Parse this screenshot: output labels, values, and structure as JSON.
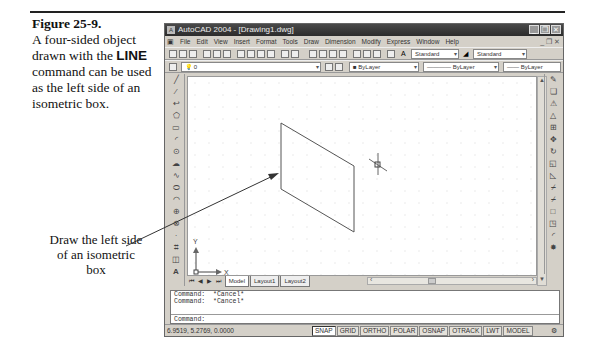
{
  "figure": {
    "number": "Figure 25-9.",
    "caption_before": "A four-sided object drawn with the",
    "caption_command": "LINE",
    "caption_after": "command can be used as the left side of an isometric box.",
    "callout": "Draw the left side of an isometric box"
  },
  "window": {
    "title": "AutoCAD 2004 - [Drawing1.dwg]",
    "controls": [
      "minimize",
      "restore",
      "close"
    ]
  },
  "menu": {
    "items": [
      "File",
      "Edit",
      "View",
      "Insert",
      "Format",
      "Tools",
      "Draw",
      "Dimension",
      "Modify",
      "Express",
      "Window",
      "Help"
    ]
  },
  "toolbars": {
    "text_style": "Standard",
    "dim_style": "Standard",
    "layer": "0",
    "color": "ByLayer",
    "linetype": "ByLayer",
    "lineweight": "ByLayer"
  },
  "draw_toolbar": [
    "line",
    "construction-line",
    "polyline",
    "polygon",
    "rectangle",
    "arc",
    "circle",
    "revision-cloud",
    "spline",
    "ellipse",
    "ellipse-arc",
    "insert-block",
    "make-block",
    "point",
    "hatch",
    "region",
    "multiline-text"
  ],
  "modify_toolbar": [
    "erase",
    "copy",
    "mirror",
    "offset",
    "array",
    "move",
    "rotate",
    "scale",
    "stretch",
    "trim",
    "extend",
    "break",
    "chamfer",
    "fillet",
    "explode"
  ],
  "ucs": {
    "x_label": "X",
    "y_label": "Y"
  },
  "layout_tabs": [
    {
      "label": "Model",
      "active": true
    },
    {
      "label": "Layout1",
      "active": false
    },
    {
      "label": "Layout2",
      "active": false
    }
  ],
  "command_history": [
    {
      "prompt": "Command:",
      "text": "*Cancel*"
    },
    {
      "prompt": "Command:",
      "text": "*Cancel*"
    }
  ],
  "command_prompt": "Command:",
  "status": {
    "coordinates": "6.9519, 5.2769, 0.0000",
    "toggles": [
      {
        "label": "SNAP",
        "on": true
      },
      {
        "label": "GRID",
        "on": false
      },
      {
        "label": "ORTHO",
        "on": false
      },
      {
        "label": "POLAR",
        "on": false
      },
      {
        "label": "OSNAP",
        "on": false
      },
      {
        "label": "OTRACK",
        "on": false
      },
      {
        "label": "LWT",
        "on": false
      },
      {
        "label": "MODEL",
        "on": false
      }
    ]
  },
  "colors": {
    "titlebar": "#2c2c2c",
    "chrome": "#d4d0c8",
    "canvas": "#ffffff",
    "rule": "#222222"
  }
}
